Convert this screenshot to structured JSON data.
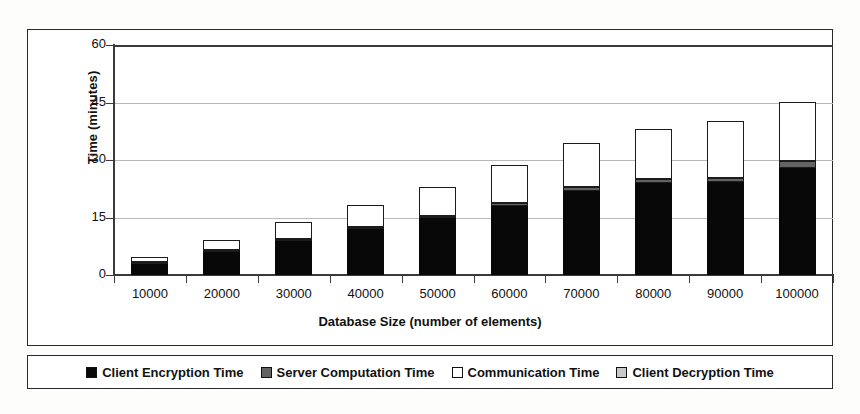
{
  "chart_data": {
    "type": "bar",
    "stacked": true,
    "title": "",
    "xlabel": "Database Size (number of elements)",
    "ylabel": "Time (minutes)",
    "ylim": [
      0,
      60
    ],
    "yticks": [
      0,
      15,
      30,
      45,
      60
    ],
    "grid": true,
    "legend_position": "bottom",
    "categories": [
      "10000",
      "20000",
      "30000",
      "40000",
      "50000",
      "60000",
      "70000",
      "80000",
      "90000",
      "100000"
    ],
    "series": [
      {
        "name": "Client Encryption Time",
        "color": "#080808",
        "values": [
          2.9,
          6.0,
          8.9,
          11.9,
          14.8,
          17.9,
          21.9,
          23.9,
          24.2,
          27.9
        ]
      },
      {
        "name": "Server Computation Time",
        "color": "#636363",
        "values": [
          0.2,
          0.3,
          0.4,
          0.5,
          0.7,
          0.8,
          1.0,
          1.1,
          1.2,
          1.8
        ]
      },
      {
        "name": "Communication Time",
        "color": "#ffffff",
        "values": [
          1.3,
          2.6,
          4.3,
          5.8,
          7.5,
          10.1,
          11.5,
          13.0,
          14.8,
          15.4
        ]
      },
      {
        "name": "Client Decryption Time",
        "color": "#c9c9c9",
        "values": [
          0.0,
          0.0,
          0.0,
          0.0,
          0.0,
          0.0,
          0.0,
          0.0,
          0.0,
          0.0
        ]
      }
    ],
    "totals": [
      4.4,
      8.9,
      13.6,
      18.2,
      23.0,
      28.8,
      34.4,
      38.0,
      40.2,
      45.1
    ]
  },
  "axes": {
    "y_title": "Time (minutes)",
    "x_title": "Database Size (number of elements)",
    "y_tick_labels": [
      "60",
      "45",
      "30",
      "15",
      "0"
    ],
    "x_tick_labels": [
      "10000",
      "20000",
      "30000",
      "40000",
      "50000",
      "60000",
      "70000",
      "80000",
      "90000",
      "100000"
    ]
  },
  "legend": {
    "items": [
      {
        "label": "Client Encryption Time",
        "swatch": "black-square-icon"
      },
      {
        "label": "Server Computation Time",
        "swatch": "gray-square-icon"
      },
      {
        "label": "Communication Time",
        "swatch": "white-square-icon"
      },
      {
        "label": "Client Decryption Time",
        "swatch": "light-gray-square-icon"
      }
    ]
  }
}
